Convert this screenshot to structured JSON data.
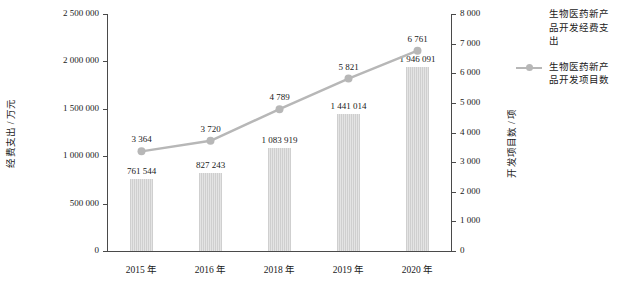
{
  "chart_data": {
    "type": "bar",
    "title": "",
    "subtitle": "",
    "categories": [
      "2015 年",
      "2016 年",
      "2018 年",
      "2019 年",
      "2020 年"
    ],
    "xlabel": "",
    "ylabel": "经费支出 / 万元",
    "y2label": "开发项目数 / 项",
    "ylim": [
      0,
      2500000
    ],
    "y2lim": [
      0,
      8000
    ],
    "grid": false,
    "legend_position": "right",
    "series": [
      {
        "name": "生物医药新产品开发经费支出",
        "type": "bar",
        "axis": "left",
        "unit": "万元",
        "values": [
          761544,
          827243,
          1083919,
          1441014,
          1946091
        ],
        "labels": [
          "761 544",
          "827 243",
          "1 083 919",
          "1 441 014",
          "1 946 091"
        ],
        "color": "#d9d9d9"
      },
      {
        "name": "生物医药新产品开发项目数",
        "type": "line",
        "axis": "right",
        "unit": "项",
        "values": [
          3364,
          3720,
          4789,
          5821,
          6761
        ],
        "labels": [
          "3 364",
          "3 720",
          "4 789",
          "5 821",
          "6 761"
        ],
        "color": "#b7b7b7"
      }
    ],
    "yticks": [
      0,
      500000,
      1000000,
      1500000,
      2000000,
      2500000
    ],
    "ytick_labels": [
      "0",
      "500 000",
      "1 000 000",
      "1 500 000",
      "2 000 000",
      "2 500 000"
    ],
    "y2ticks": [
      0,
      1000,
      2000,
      3000,
      4000,
      5000,
      6000,
      7000,
      8000
    ],
    "y2tick_labels": [
      "0",
      "1 000",
      "2 000",
      "3 000",
      "4 000",
      "5 000",
      "6 000",
      "7 000",
      "8 000"
    ]
  },
  "axes": {
    "left_title": "经费支出 / 万元",
    "right_title": "开发项目数 / 项"
  },
  "legend": {
    "items": [
      {
        "label": "生物医药新产品开发经费支出",
        "marker": "bar-swatch"
      },
      {
        "label": "生物医药新产品开发项目数",
        "marker": "line-marker-swatch"
      }
    ]
  }
}
